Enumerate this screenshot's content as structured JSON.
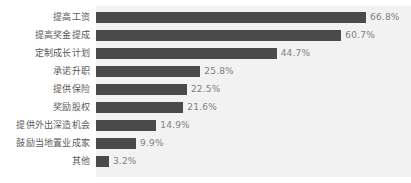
{
  "chart_data": {
    "type": "bar",
    "orientation": "horizontal",
    "title": "",
    "subtitle": "",
    "xlabel": "",
    "ylabel": "",
    "grid": false,
    "legend": false,
    "legend_position": "none",
    "axis_visible": false,
    "xlim": [
      0,
      70
    ],
    "value_suffix": "%",
    "colors": {
      "bar": "#4a4a4a",
      "plot_background": "#f2f2f2",
      "page_background": "#ffffff",
      "category_label": "#595959",
      "value_label": "#7f7f7f"
    },
    "categories": [
      "提高工资",
      "提高奖金提成",
      "定制成长计划",
      "承诺升职",
      "提供保险",
      "奖励股权",
      "提供外出深造机会",
      "鼓励当地置业成家",
      "其他"
    ],
    "values": [
      66.8,
      60.7,
      44.7,
      25.8,
      22.5,
      21.6,
      14.9,
      9.9,
      3.2
    ],
    "value_labels": [
      "66.8%",
      "60.7%",
      "44.7%",
      "25.8%",
      "22.5%",
      "21.6%",
      "14.9%",
      "9.9%",
      "3.2%"
    ],
    "bars": [
      {
        "category": "提高工资",
        "value": 66.8,
        "label": "66.8%"
      },
      {
        "category": "提高奖金提成",
        "value": 60.7,
        "label": "60.7%"
      },
      {
        "category": "定制成长计划",
        "value": 44.7,
        "label": "44.7%"
      },
      {
        "category": "承诺升职",
        "value": 25.8,
        "label": "25.8%"
      },
      {
        "category": "提供保险",
        "value": 22.5,
        "label": "22.5%"
      },
      {
        "category": "奖励股权",
        "value": 21.6,
        "label": "21.6%"
      },
      {
        "category": "提供外出深造机会",
        "value": 14.9,
        "label": "14.9%"
      },
      {
        "category": "鼓励当地置业成家",
        "value": 9.9,
        "label": "9.9%"
      },
      {
        "category": "其他",
        "value": 3.2,
        "label": "3.2%"
      }
    ]
  }
}
